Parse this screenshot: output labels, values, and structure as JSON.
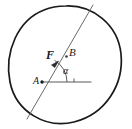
{
  "figure": {
    "background_color": "#ffffff",
    "stroke_color": "#1a1a1a",
    "line_color": "#4a4a4a",
    "labels": {
      "force_vector": "F",
      "point_b": "B",
      "point_a": "A",
      "angle": "α"
    },
    "geometry": {
      "circle": {
        "center_x": 66,
        "center_y": 64,
        "radius_x": 56,
        "radius_y": 58,
        "stroke_width": 1.6
      },
      "chord_line": {
        "x1": 27,
        "y1": 119,
        "x2": 93,
        "y2": 5,
        "stroke_width": 1.0
      },
      "horizontal_line": {
        "x1": 42,
        "y1": 82,
        "x2": 92,
        "y2": 82,
        "stroke_width": 1.2
      },
      "point_a_marker": {
        "cx": 42,
        "cy": 82,
        "r": 1.6
      },
      "point_b_marker": {
        "cx": 66,
        "cy": 57,
        "r": 1.4
      },
      "angle_arc": {
        "center_x": 42,
        "center_y": 82,
        "radius": 26,
        "start_deg": 0,
        "end_deg": 60
      },
      "vector_arrowhead": {
        "tip_x": 57,
        "tip_y": 62,
        "angle_deg": 60
      }
    }
  }
}
